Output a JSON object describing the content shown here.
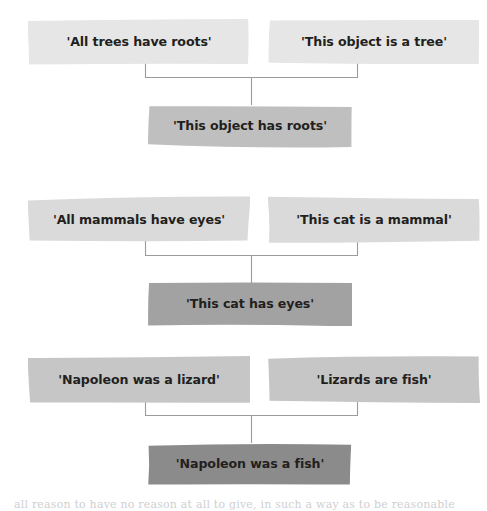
{
  "figure": {
    "type": "syllogism-diagram",
    "background_color": "#ffffff",
    "text_color": "#231f20",
    "connector_color": "#9b9b9b"
  },
  "groups": [
    {
      "id": "group-1",
      "premise_left": "'All trees have roots'",
      "premise_right": "'This object is a tree'",
      "conclusion": "'This object has roots'",
      "premise_color": "#e6e6e6",
      "conclusion_color": "#bfbfbf",
      "top": 18
    },
    {
      "id": "group-2",
      "premise_left": "'All mammals have eyes'",
      "premise_right": "'This cat is a mammal'",
      "conclusion": "'This cat has eyes'",
      "premise_color": "#dadada",
      "conclusion_color": "#a2a2a2",
      "top": 196
    },
    {
      "id": "group-3",
      "premise_left": "'Napoleon was a lizard'",
      "premise_right": "'Lizards are fish'",
      "conclusion": "'Napoleon was a fish'",
      "premise_color": "#c6c6c6",
      "conclusion_color": "#8b8b8b",
      "top": 356
    }
  ],
  "bottom_caption": {
    "text": "all reason to have no reason at all to give, in such a way as to be reasonable",
    "top": 498
  }
}
